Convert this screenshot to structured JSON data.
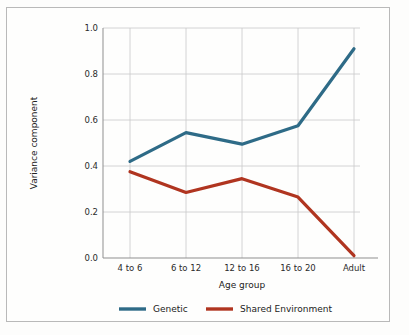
{
  "chart_data": {
    "type": "line",
    "title": "",
    "xlabel": "Age group",
    "ylabel": "Variance component",
    "categories": [
      "4 to 6",
      "6 to 12",
      "12 to 16",
      "16 to 20",
      "Adult"
    ],
    "series": [
      {
        "name": "Genetic",
        "color": "#2e6b87",
        "values": [
          0.42,
          0.545,
          0.495,
          0.575,
          0.91
        ]
      },
      {
        "name": "Shared Environment",
        "color": "#b03520",
        "values": [
          0.375,
          0.285,
          0.345,
          0.265,
          0.01
        ]
      }
    ],
    "ylim": [
      0.0,
      1.0
    ],
    "ytick_labels": [
      "0.0",
      "0.2",
      "0.4",
      "0.6",
      "0.8",
      "1.0"
    ],
    "ytick_values": [
      0.0,
      0.2,
      0.4,
      0.6,
      0.8,
      1.0
    ],
    "grid": true,
    "grid_color": "#c9c9c9",
    "legend_position": "bottom",
    "axis_color": "#8f8f8f",
    "background": "#fefefd",
    "frame_color": "#b9b9b9"
  }
}
